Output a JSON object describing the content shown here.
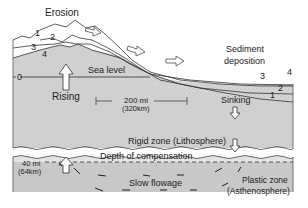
{
  "labels": {
    "erosion": "Erosion",
    "sediment_line1": "Sediment",
    "sediment_line2": "deposition",
    "sea_level": "Sea level",
    "rising": "Rising",
    "sinking": "Sinking",
    "scale_mi": "200 mi",
    "scale_km": "(320km)",
    "rigid_zone": "Rigid zone (Lithosphere)",
    "depth_comp": "Depth of compensation",
    "slow_flowage": "Slow flowage",
    "plastic_line1": "Plastic zone",
    "plastic_line2": "(Asthenosphere)",
    "depth_mi": "40 mi",
    "depth_km": "(64km)"
  },
  "surface_numbers_left": [
    "1",
    "2",
    "3",
    "4"
  ],
  "surface_numbers_right": [
    "3",
    "4",
    "2",
    "1"
  ],
  "sea_level_number": "0",
  "colors": {
    "crust_fill": "#cfcfcf",
    "lithosphere_fill": "#e2e2e2",
    "asthenosphere_fill": "#c4c4c4",
    "line": "#333333"
  }
}
